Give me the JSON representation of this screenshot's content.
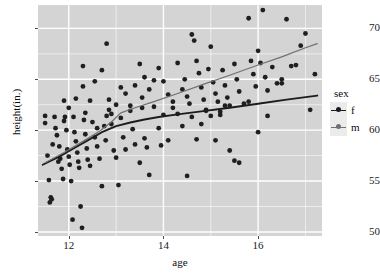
{
  "chart_data": {
    "type": "scatter",
    "title": "",
    "xlabel": "age",
    "ylabel": "height(in.)",
    "xlim": [
      11.35,
      17.35
    ],
    "ylim": [
      49.6,
      72.3
    ],
    "xticks": [
      12,
      14,
      16
    ],
    "yticks": [
      50,
      55,
      60,
      65,
      70
    ],
    "xtick_labels": [
      "12",
      "14",
      "16"
    ],
    "ytick_labels": [
      "50",
      "55",
      "60",
      "65",
      "70"
    ],
    "grid": true,
    "grid_color": "#ffffff",
    "panel_background": "#d4d4d4",
    "legend": {
      "title": "sex",
      "position": "right",
      "entries": [
        {
          "label": "f",
          "color": "#1c1c1c"
        },
        {
          "label": "m",
          "color": "#707070"
        }
      ]
    },
    "point_color": "#1f1f1f",
    "point_size": 2.4,
    "series": [
      {
        "name": "f",
        "color": "#1c1c1c",
        "fit_type": "loess",
        "fit_x": [
          11.45,
          11.8,
          12.1,
          12.4,
          12.7,
          13.0,
          13.3,
          13.6,
          13.9,
          14.3,
          14.8,
          15.4,
          16.0,
          16.6,
          17.25
        ],
        "fit_y": [
          56.6,
          57.4,
          58.2,
          59.0,
          59.8,
          60.4,
          60.75,
          61.05,
          61.3,
          61.55,
          61.85,
          62.2,
          62.6,
          63.0,
          63.4
        ],
        "points": [
          [
            11.5,
            61.4
          ],
          [
            11.5,
            60.7
          ],
          [
            11.55,
            57.5
          ],
          [
            11.58,
            55.1
          ],
          [
            11.6,
            52.9
          ],
          [
            11.62,
            53.4
          ],
          [
            11.64,
            53.2
          ],
          [
            11.66,
            58.6
          ],
          [
            11.7,
            61.3
          ],
          [
            11.72,
            60.2
          ],
          [
            11.75,
            59.5
          ],
          [
            11.78,
            56.9
          ],
          [
            11.8,
            58.4
          ],
          [
            11.82,
            57.2
          ],
          [
            11.85,
            56.2
          ],
          [
            11.88,
            55.2
          ],
          [
            11.9,
            62.9
          ],
          [
            11.92,
            61.3
          ],
          [
            11.95,
            60.0
          ],
          [
            11.97,
            58.1
          ],
          [
            12.0,
            57.4
          ],
          [
            12.02,
            56.6
          ],
          [
            12.05,
            55.0
          ],
          [
            12.08,
            51.2
          ],
          [
            12.1,
            61.3
          ],
          [
            12.12,
            59.8
          ],
          [
            12.15,
            58.9
          ],
          [
            12.18,
            57.8
          ],
          [
            12.2,
            56.9
          ],
          [
            12.22,
            56.3
          ],
          [
            12.25,
            52.5
          ],
          [
            12.28,
            50.4
          ],
          [
            12.3,
            64.3
          ],
          [
            12.32,
            61.0
          ],
          [
            12.35,
            59.6
          ],
          [
            12.38,
            58.2
          ],
          [
            12.4,
            57.1
          ],
          [
            12.45,
            56.5
          ],
          [
            12.5,
            60.8
          ],
          [
            12.55,
            59.3
          ],
          [
            12.6,
            58.4
          ],
          [
            12.65,
            57.2
          ],
          [
            12.7,
            54.5
          ],
          [
            12.75,
            60.4
          ],
          [
            12.78,
            59.0
          ],
          [
            12.8,
            61.4
          ],
          [
            12.85,
            62.0
          ],
          [
            12.9,
            60.6
          ],
          [
            12.95,
            58.0
          ],
          [
            13.0,
            57.3
          ],
          [
            13.05,
            54.6
          ],
          [
            13.1,
            61.2
          ],
          [
            13.15,
            59.3
          ],
          [
            13.2,
            58.1
          ],
          [
            13.3,
            62.4
          ],
          [
            13.35,
            60.1
          ],
          [
            13.4,
            58.6
          ],
          [
            13.5,
            56.8
          ],
          [
            13.55,
            62.2
          ],
          [
            13.6,
            59.2
          ],
          [
            13.65,
            58.3
          ],
          [
            13.7,
            55.6
          ],
          [
            13.8,
            64.9
          ],
          [
            13.9,
            60.2
          ],
          [
            13.95,
            58.5
          ],
          [
            14.0,
            61.5
          ],
          [
            14.1,
            59.0
          ],
          [
            14.2,
            62.8
          ],
          [
            14.3,
            61.6
          ],
          [
            14.4,
            60.4
          ],
          [
            14.5,
            55.5
          ],
          [
            14.6,
            61.3
          ],
          [
            14.7,
            59.1
          ],
          [
            14.8,
            60.6
          ],
          [
            14.9,
            62.0
          ],
          [
            15.0,
            61.4
          ],
          [
            15.1,
            59.0
          ],
          [
            15.2,
            61.8
          ],
          [
            15.3,
            62.4
          ],
          [
            15.4,
            58.0
          ],
          [
            15.5,
            57.0
          ],
          [
            15.6,
            56.8
          ],
          [
            15.8,
            62.8
          ],
          [
            16.0,
            59.8
          ],
          [
            16.2,
            61.4
          ],
          [
            16.5,
            64.6
          ],
          [
            16.8,
            66.4
          ],
          [
            17.1,
            62.0
          ],
          [
            17.2,
            65.5
          ]
        ]
      },
      {
        "name": "m",
        "color": "#707070",
        "fit_type": "loess",
        "fit_x": [
          11.5,
          11.9,
          12.3,
          12.65,
          12.9,
          13.1,
          13.4,
          13.8,
          14.3,
          14.9,
          15.4,
          16.0,
          16.5,
          17.0,
          17.25
        ],
        "fit_y": [
          56.8,
          57.8,
          58.9,
          59.9,
          60.8,
          61.7,
          62.2,
          62.8,
          63.6,
          64.6,
          65.4,
          66.4,
          67.2,
          68.1,
          68.5
        ],
        "points": [
          [
            11.9,
            60.9
          ],
          [
            12.0,
            62.2
          ],
          [
            12.15,
            63.1
          ],
          [
            12.3,
            66.3
          ],
          [
            12.35,
            61.7
          ],
          [
            12.45,
            62.9
          ],
          [
            12.55,
            64.8
          ],
          [
            12.6,
            60.2
          ],
          [
            12.7,
            65.9
          ],
          [
            12.8,
            68.5
          ],
          [
            12.85,
            63.0
          ],
          [
            12.9,
            61.6
          ],
          [
            13.0,
            62.5
          ],
          [
            13.1,
            64.2
          ],
          [
            13.2,
            63.6
          ],
          [
            13.3,
            61.9
          ],
          [
            13.4,
            64.4
          ],
          [
            13.5,
            66.5
          ],
          [
            13.55,
            63.2
          ],
          [
            13.6,
            65.2
          ],
          [
            13.7,
            64.0
          ],
          [
            13.8,
            62.3
          ],
          [
            13.9,
            66.1
          ],
          [
            14.0,
            64.8
          ],
          [
            14.1,
            63.5
          ],
          [
            14.2,
            62.2
          ],
          [
            14.3,
            66.6
          ],
          [
            14.4,
            64.0
          ],
          [
            14.45,
            65.0
          ],
          [
            14.5,
            63.3
          ],
          [
            14.55,
            62.6
          ],
          [
            14.6,
            69.4
          ],
          [
            14.65,
            68.8
          ],
          [
            14.7,
            66.8
          ],
          [
            14.75,
            65.6
          ],
          [
            14.8,
            64.2
          ],
          [
            14.85,
            63.0
          ],
          [
            14.9,
            61.9
          ],
          [
            14.95,
            66.0
          ],
          [
            15.0,
            68.2
          ],
          [
            15.05,
            64.7
          ],
          [
            15.1,
            63.6
          ],
          [
            15.15,
            62.8
          ],
          [
            15.2,
            61.5
          ],
          [
            15.25,
            65.9
          ],
          [
            15.3,
            64.4
          ],
          [
            15.35,
            63.2
          ],
          [
            15.4,
            62.4
          ],
          [
            15.5,
            66.5
          ],
          [
            15.55,
            65.0
          ],
          [
            15.6,
            63.8
          ],
          [
            15.7,
            62.6
          ],
          [
            15.8,
            71.0
          ],
          [
            15.85,
            66.8
          ],
          [
            15.9,
            65.5
          ],
          [
            15.95,
            64.3
          ],
          [
            16.0,
            67.8
          ],
          [
            16.05,
            66.6
          ],
          [
            16.1,
            71.8
          ],
          [
            16.15,
            65.2
          ],
          [
            16.2,
            63.9
          ],
          [
            16.3,
            66.2
          ],
          [
            16.4,
            64.6
          ],
          [
            16.5,
            65.0
          ],
          [
            16.6,
            70.9
          ],
          [
            16.7,
            66.3
          ],
          [
            16.9,
            68.3
          ],
          [
            17.0,
            69.5
          ]
        ]
      }
    ]
  }
}
